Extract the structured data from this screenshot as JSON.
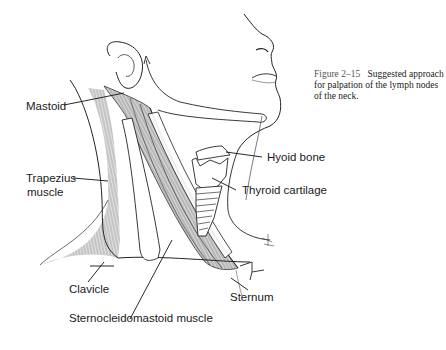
{
  "caption": {
    "figure_number": "Figure 2–15",
    "text": "Suggested approach for palpation of the lymph nodes of the neck."
  },
  "labels": {
    "mastoid": "Mastoid",
    "trapezius_line1": "Trapezius",
    "trapezius_line2": "muscle",
    "hyoid": "Hyoid bone",
    "thyroid": "Thyroid cartilage",
    "clavicle": "Clavicle",
    "sternum": "Sternum",
    "scm": "Sternocleidomastoid muscle"
  },
  "colors": {
    "ink": "#1a1a1a",
    "shading": "#d9d9d9",
    "background": "#ffffff"
  }
}
